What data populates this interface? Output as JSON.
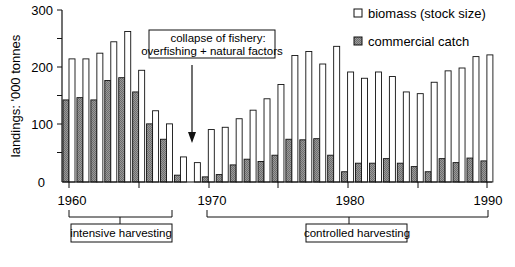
{
  "chart_data": {
    "type": "bar",
    "title": "",
    "xlabel": "",
    "ylabel": "landings: '000 tonnes",
    "ylim": [
      0,
      300
    ],
    "yticks": [
      0,
      100,
      200,
      300
    ],
    "xticks_labeled": [
      1960,
      1970,
      1980,
      1990
    ],
    "grid": false,
    "legend_position": "top-right",
    "categories": [
      1960,
      1961,
      1962,
      1963,
      1964,
      1965,
      1966,
      1967,
      1968,
      1969,
      1970,
      1971,
      1972,
      1973,
      1974,
      1975,
      1976,
      1977,
      1978,
      1979,
      1980,
      1981,
      1982,
      1983,
      1984,
      1985,
      1986,
      1987,
      1988,
      1989,
      1990
    ],
    "series": [
      {
        "name": "commercial catch",
        "style": "hatched-gray",
        "values": [
          144,
          148,
          144,
          178,
          183,
          158,
          102,
          75,
          12,
          0,
          9,
          13,
          30,
          40,
          36,
          47,
          75,
          74,
          76,
          47,
          18,
          33,
          33,
          41,
          33,
          27,
          18,
          41,
          34,
          42,
          37
        ]
      },
      {
        "name": "biomass (stock size)",
        "style": "white",
        "values": [
          216,
          216,
          226,
          246,
          264,
          196,
          125,
          102,
          44,
          34,
          92,
          96,
          111,
          126,
          146,
          171,
          222,
          229,
          207,
          238,
          193,
          182,
          193,
          185,
          158,
          155,
          175,
          195,
          200,
          220,
          223
        ]
      }
    ],
    "annotations": [
      {
        "text_lines": [
          "collapse of fishery:",
          "overfishing + natural factors"
        ],
        "arrow_to_year": 1968.7
      },
      {
        "text": "intensive harvesting",
        "range": [
          1960,
          1965
        ]
      },
      {
        "text": "controlled harvesting",
        "range": [
          1970,
          1990
        ]
      }
    ]
  },
  "axis": {
    "ylabel": "landings: '000 tonnes",
    "yticks": [
      "0",
      "100",
      "200",
      "300"
    ],
    "xticks": [
      "1960",
      "1970",
      "1980",
      "1990"
    ]
  },
  "legend": {
    "biomass": "biomass (stock size)",
    "catch": "commercial catch"
  },
  "callout": {
    "line1": "collapse of fishery:",
    "line2": "overfishing + natural factors"
  },
  "periods": {
    "intensive": "intensive harvesting",
    "controlled": "controlled harvesting"
  },
  "colors": {
    "catch_fill": "#8a8a8a",
    "biomass_fill": "#ffffff",
    "stroke": "#111111"
  }
}
